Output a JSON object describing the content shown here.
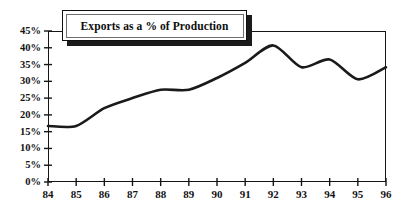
{
  "chart_data": {
    "type": "line",
    "title": "Exports as a % of Production",
    "xlabel": "",
    "ylabel": "",
    "xlim": [
      84,
      96
    ],
    "ylim": [
      0,
      45
    ],
    "grid": false,
    "legend": null,
    "line_color": "#1a1a1a",
    "background_color": "#ffffff",
    "x": [
      84,
      85,
      86,
      87,
      88,
      89,
      90,
      91,
      92,
      93,
      94,
      95,
      96
    ],
    "categories": [
      "84",
      "85",
      "86",
      "87",
      "88",
      "89",
      "90",
      "91",
      "92",
      "93",
      "94",
      "95",
      "96"
    ],
    "values": [
      16.7,
      16.7,
      22.0,
      25.0,
      27.5,
      27.5,
      31.0,
      35.5,
      40.7,
      34.2,
      36.5,
      30.6,
      34.2
    ],
    "series": [
      {
        "name": "Exports as a % of Production",
        "values": [
          16.7,
          16.7,
          22.0,
          25.0,
          27.5,
          27.5,
          31.0,
          35.5,
          40.7,
          34.2,
          36.5,
          30.6,
          34.2
        ]
      }
    ],
    "ytick_labels": [
      "45%",
      "40%",
      "35%",
      "30%",
      "25%",
      "20%",
      "15%",
      "10%",
      "5%",
      "0%"
    ],
    "ytick_values": [
      45,
      40,
      35,
      30,
      25,
      20,
      15,
      10,
      5,
      0
    ],
    "xtick_labels": [
      "84",
      "85",
      "86",
      "87",
      "88",
      "89",
      "90",
      "91",
      "92",
      "93",
      "94",
      "95",
      "96"
    ],
    "annotations": []
  }
}
